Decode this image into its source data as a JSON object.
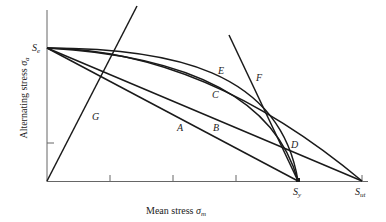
{
  "diagram": {
    "xlabel": "Mean stress",
    "xlabel_symbol": "σ",
    "xlabel_sub": "m",
    "ylabel": "Alternating stress",
    "ylabel_symbol": "σ",
    "ylabel_sub": "a",
    "points": {
      "Se": {
        "main": "S",
        "sub": "e"
      },
      "Sy": {
        "main": "S",
        "sub": "y"
      },
      "Sut": {
        "main": "S",
        "sub": "ut"
      }
    },
    "curve_labels": {
      "A": "A",
      "B": "B",
      "C": "C",
      "D": "D",
      "E": "E",
      "F": "F",
      "G": "G"
    },
    "colors": {
      "line": "#1a1a1a",
      "axis": "#555555",
      "background": "#ffffff"
    }
  }
}
